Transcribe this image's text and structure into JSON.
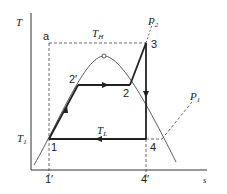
{
  "diagram": {
    "type": "T-s diagram (vapor compression refrigeration cycle)",
    "axes": {
      "y_label": "T",
      "x_label": "s"
    },
    "isotherms": {
      "high": {
        "symbol": "T",
        "subscript": "H"
      },
      "low": {
        "symbol": "T",
        "subscript": "L"
      },
      "left": {
        "symbol": "T",
        "subscript": "1"
      }
    },
    "pressure_lines": {
      "high": {
        "symbol": "P",
        "subscript": "2"
      },
      "low": {
        "symbol": "P",
        "subscript": "1"
      }
    },
    "points": {
      "a": "a",
      "p1": "1",
      "p2": "2",
      "p2prime": "2′",
      "p3": "3",
      "p4": "4",
      "p1prime": "1′",
      "p4prime": "4′"
    },
    "colors": {
      "line": "#222222",
      "dashed": "#444444",
      "background": "#ffffff"
    }
  }
}
